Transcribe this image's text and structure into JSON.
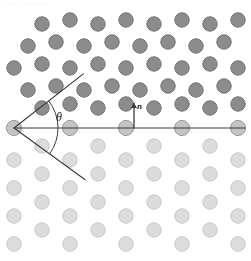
{
  "figure": {
    "width": 251,
    "height": 261,
    "background": "#ffffff",
    "header_fragment": " · ··· ·· ····"
  },
  "annotations": {
    "angle_label": "θ",
    "normal_label": "n",
    "angle_label_x": 56,
    "angle_label_y": 110,
    "normal_label_x": 137,
    "normal_label_y": 101
  },
  "colors": {
    "upper_grain_fill": "#8c8c8c",
    "upper_grain_stroke": "#6f6f6f",
    "boundary_row_fill": "#c4c4c4",
    "boundary_row_stroke": "#9a9a9a",
    "lower_grain_fill": "#dcdcdc",
    "lower_grain_stroke": "#c6c6c6",
    "line_color": "#3a3a3a",
    "arc_color": "#3a3a3a",
    "text_color": "#1a1a1a",
    "background": "#ffffff"
  },
  "geometry": {
    "vertex_x": 14,
    "vertex_y": 128,
    "boundary_y": 128,
    "boundary_x_start": 14,
    "boundary_x_end": 245,
    "upper_ray_angle_deg": 38,
    "lower_ray_angle_deg": -36,
    "ray_length": 88,
    "arc_radius": 44,
    "normal_arrow_x": 134,
    "normal_arrow_base_y": 128,
    "normal_arrow_tip_y": 103,
    "atom_radius": 7.2,
    "upper_lattice_rotation_deg": -9,
    "upper_lattice_spacing": 27,
    "lower_lattice_spacing": 27,
    "lower_lattice_rotation_deg": 0
  },
  "chart_data": {
    "type": "scatter",
    "xlabel": "",
    "ylabel": "",
    "xlim": [
      0,
      251
    ],
    "ylim": [
      0,
      261
    ],
    "grid": false,
    "legend_position": "none",
    "series": [
      {
        "name": "upper grain atoms",
        "color": "#8c8c8c",
        "marker": "circle",
        "marker_radius": 7.2,
        "lattice": "hexagonal",
        "rotation_deg": -9,
        "spacing": 27,
        "points": [
          [
            42,
            24
          ],
          [
            70,
            20
          ],
          [
            98,
            24
          ],
          [
            126,
            20
          ],
          [
            154,
            24
          ],
          [
            182,
            20
          ],
          [
            210,
            24
          ],
          [
            238,
            20
          ],
          [
            28,
            46
          ],
          [
            56,
            42
          ],
          [
            84,
            46
          ],
          [
            112,
            42
          ],
          [
            140,
            46
          ],
          [
            168,
            42
          ],
          [
            196,
            46
          ],
          [
            224,
            42
          ],
          [
            14,
            68
          ],
          [
            42,
            64
          ],
          [
            70,
            68
          ],
          [
            98,
            64
          ],
          [
            126,
            68
          ],
          [
            154,
            64
          ],
          [
            182,
            68
          ],
          [
            210,
            64
          ],
          [
            238,
            68
          ],
          [
            28,
            90
          ],
          [
            56,
            86
          ],
          [
            84,
            90
          ],
          [
            112,
            86
          ],
          [
            140,
            90
          ],
          [
            168,
            86
          ],
          [
            196,
            90
          ],
          [
            224,
            86
          ],
          [
            42,
            108
          ],
          [
            70,
            104
          ],
          [
            98,
            108
          ],
          [
            126,
            104
          ],
          [
            154,
            108
          ],
          [
            182,
            104
          ],
          [
            210,
            108
          ],
          [
            238,
            104
          ]
        ]
      },
      {
        "name": "boundary row atoms",
        "color": "#c4c4c4",
        "marker": "circle",
        "marker_radius": 7.6,
        "points": [
          [
            14,
            128
          ],
          [
            70,
            128
          ],
          [
            126,
            128
          ],
          [
            182,
            128
          ],
          [
            238,
            128
          ]
        ]
      },
      {
        "name": "lower grain atoms",
        "color": "#dcdcdc",
        "marker": "circle",
        "marker_radius": 7.2,
        "lattice": "hexagonal",
        "rotation_deg": 0,
        "spacing": 27,
        "points": [
          [
            42,
            146
          ],
          [
            98,
            146
          ],
          [
            154,
            146
          ],
          [
            210,
            146
          ],
          [
            14,
            160
          ],
          [
            70,
            160
          ],
          [
            126,
            160
          ],
          [
            182,
            160
          ],
          [
            238,
            160
          ],
          [
            42,
            174
          ],
          [
            98,
            174
          ],
          [
            154,
            174
          ],
          [
            210,
            174
          ],
          [
            14,
            188
          ],
          [
            70,
            188
          ],
          [
            126,
            188
          ],
          [
            182,
            188
          ],
          [
            238,
            188
          ],
          [
            42,
            202
          ],
          [
            98,
            202
          ],
          [
            154,
            202
          ],
          [
            210,
            202
          ],
          [
            14,
            216
          ],
          [
            70,
            216
          ],
          [
            126,
            216
          ],
          [
            182,
            216
          ],
          [
            238,
            216
          ],
          [
            42,
            230
          ],
          [
            98,
            230
          ],
          [
            154,
            230
          ],
          [
            210,
            230
          ],
          [
            14,
            244
          ],
          [
            70,
            244
          ],
          [
            126,
            244
          ],
          [
            182,
            244
          ],
          [
            238,
            244
          ]
        ]
      }
    ],
    "annotations": [
      {
        "type": "line",
        "name": "boundary-line",
        "x1": 14,
        "y1": 128,
        "x2": 245,
        "y2": 128
      },
      {
        "type": "ray",
        "name": "upper-ray",
        "x1": 14,
        "y1": 128,
        "angle_deg": 38,
        "length": 88
      },
      {
        "type": "ray",
        "name": "lower-ray",
        "x1": 14,
        "y1": 128,
        "angle_deg": -36,
        "length": 88
      },
      {
        "type": "arc",
        "name": "angle-arc",
        "cx": 14,
        "cy": 128,
        "radius": 44,
        "start_deg": 38,
        "end_deg": -36
      },
      {
        "type": "arrow",
        "name": "normal-vector",
        "x1": 134,
        "y1": 128,
        "x2": 134,
        "y2": 103,
        "label": "n"
      },
      {
        "type": "text",
        "name": "angle-symbol",
        "x": 56,
        "y": 110,
        "text": "θ"
      }
    ]
  }
}
